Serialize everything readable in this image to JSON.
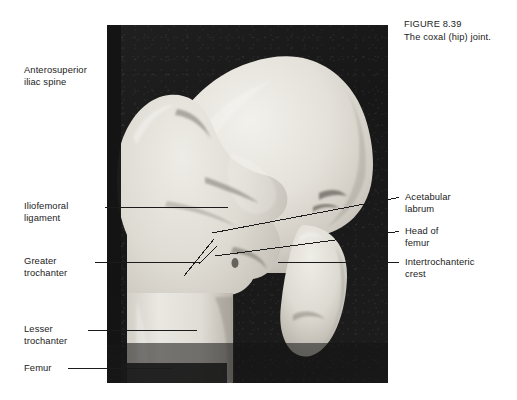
{
  "figure": {
    "caption_number": "FIGURE 8.39",
    "caption_text": "The coxal (hip) joint.",
    "background_color": "#ffffff",
    "plate_background_color": "#191919",
    "bone_color": "#e6e4df",
    "leader_line_color": "#1b1b1b",
    "text_color": "#1b1b1b"
  },
  "labels_left": [
    {
      "name": "anterosuperior-iliac-spine",
      "line1": "Anterosuperior",
      "line2": "iliac spine"
    },
    {
      "name": "iliofemoral-ligament",
      "line1": "Iliofemoral",
      "line2": "ligament"
    },
    {
      "name": "greater-trochanter",
      "line1": "Greater",
      "line2": "trochanter"
    },
    {
      "name": "lesser-trochanter",
      "line1": "Lesser",
      "line2": "trochanter"
    },
    {
      "name": "femur",
      "line1": "Femur",
      "line2": ""
    }
  ],
  "labels_right": [
    {
      "name": "acetabular-labrum",
      "line1": "Acetabular",
      "line2": "labrum"
    },
    {
      "name": "head-of-femur",
      "line1": "Head of",
      "line2": "femur"
    },
    {
      "name": "intertrochanteric-crest",
      "line1": "Intertrochanteric",
      "line2": "crest"
    }
  ]
}
